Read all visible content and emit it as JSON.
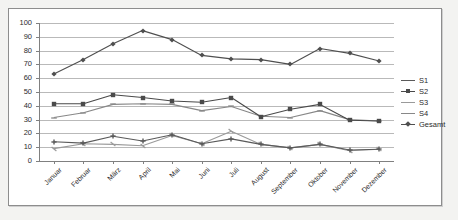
{
  "chart_data": {
    "type": "line",
    "title": "",
    "xlabel": "",
    "ylabel": "",
    "ylim": [
      0,
      100
    ],
    "ytick_step": 10,
    "yticks": [
      "100",
      "90",
      "80",
      "70",
      "60",
      "50",
      "40",
      "30",
      "20",
      "10",
      "0"
    ],
    "grid": true,
    "legend_position": "right",
    "categories": [
      "Januar",
      "Februar",
      "März",
      "April",
      "Mai",
      "Juni",
      "Juli",
      "August",
      "September",
      "Oktober",
      "November",
      "Dezember"
    ],
    "series": [
      {
        "name": "S1",
        "color": "#5a5a5a",
        "marker": "plus",
        "values": [
          14,
          13,
          18,
          14.5,
          19,
          12.5,
          16,
          12,
          9.5,
          12,
          8,
          8.5
        ]
      },
      {
        "name": "S2",
        "color": "#4a4a4a",
        "marker": "square",
        "values": [
          41.5,
          41.5,
          48,
          46,
          43.5,
          42.5,
          46,
          32,
          37.5,
          41,
          29.5,
          29
        ]
      },
      {
        "name": "S3",
        "color": "#9a9a9a",
        "marker": "tick",
        "values": [
          9,
          12.5,
          12,
          11,
          18.5,
          12.5,
          21.5,
          12,
          9.5,
          12,
          7.5,
          8.5
        ]
      },
      {
        "name": "S4",
        "color": "#888888",
        "marker": "dash",
        "values": [
          31.5,
          35,
          41,
          41.5,
          41,
          36.5,
          39.5,
          32.5,
          31.5,
          36.5,
          30,
          29
        ]
      },
      {
        "name": "Gesamt",
        "color": "#4f4f4f",
        "marker": "diamond",
        "values": [
          63,
          73.5,
          85,
          94.5,
          88,
          76.5,
          74,
          73.5,
          70,
          81.5,
          78,
          72.5
        ]
      }
    ]
  },
  "legend": {
    "items": [
      {
        "label": "S1"
      },
      {
        "label": "S2"
      },
      {
        "label": "S3"
      },
      {
        "label": "S4"
      },
      {
        "label": "Gesamt"
      }
    ]
  },
  "colors": {
    "plot_background": "#ffffff",
    "page_background": "#f3f3f1",
    "gridline": "#b9b9b9",
    "axis": "#808080",
    "frame_border": "#8d8d8d",
    "text": "#2b2b2b"
  }
}
